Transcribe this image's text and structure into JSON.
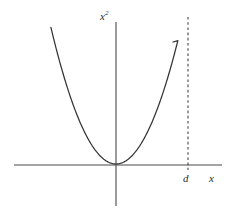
{
  "figure": {
    "title": "",
    "background_color": "#ffffff",
    "width": 236,
    "height": 215
  },
  "labels": {
    "y_axis_base": "x",
    "y_axis_exponent": "2",
    "y_axis_full": "x²",
    "x_axis": "x",
    "marker": "d"
  },
  "colors": {
    "axis": "#4a4a4a",
    "curve": "#333333",
    "dashed": "#3d3d3d",
    "text": "#2b2b2b"
  },
  "chart_data": {
    "type": "line",
    "title": "",
    "xlabel": "x",
    "ylabel": "x²",
    "grid": false,
    "legend": null,
    "annotations": [
      {
        "label": "d",
        "type": "vertical-dashed-line",
        "x": 1.16,
        "note": "dashed vertical line at x = d, to the right of the plotted branch"
      }
    ],
    "origin_px": {
      "x": 116,
      "y": 164
    },
    "axis_extent_px": {
      "x_axis": {
        "x1": 14,
        "x2": 222,
        "y": 165
      },
      "y_axis": {
        "x": 116,
        "y1": 22,
        "y2": 206
      }
    },
    "curve_extent_px": {
      "left_top": {
        "x": 54,
        "y": 40
      },
      "right_top": {
        "x": 173,
        "y": 42
      },
      "vertex": {
        "x": 116,
        "y": 164
      }
    },
    "dashed_line_px": {
      "x": 188,
      "y1": 17,
      "y2": 170
    },
    "function": "y = x^2",
    "series": [
      {
        "name": "x²",
        "x": [
          -1.0,
          -0.9,
          -0.8,
          -0.7,
          -0.6,
          -0.5,
          -0.4,
          -0.3,
          -0.2,
          -0.1,
          0.0,
          0.1,
          0.2,
          0.3,
          0.4,
          0.5,
          0.6,
          0.7,
          0.8,
          0.9,
          1.0
        ],
        "values": [
          1.0,
          0.81,
          0.64,
          0.49,
          0.36,
          0.25,
          0.16,
          0.09,
          0.04,
          0.01,
          0.0,
          0.01,
          0.04,
          0.09,
          0.16,
          0.25,
          0.36,
          0.49,
          0.64,
          0.81,
          1.0
        ]
      }
    ],
    "xlim": [
      -1.05,
      1.16
    ],
    "ylim": [
      0,
      1.0
    ],
    "xticks": [],
    "yticks": []
  }
}
